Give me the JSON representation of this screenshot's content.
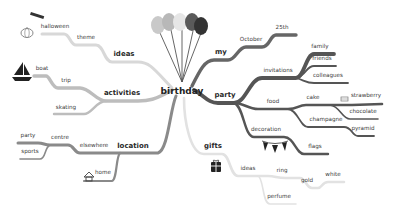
{
  "root": {
    "label": "birthday",
    "x": 182,
    "y": 91
  },
  "colors": {
    "ideas": "#d8d8d8",
    "activities": "#bdbdbd",
    "location": "#8a8a8a",
    "my": "#666666",
    "party": "#555555",
    "gifts": "#e2e2e2"
  },
  "nodes": [
    {
      "id": "ideas",
      "label": "ideas",
      "x": 124,
      "y": 58,
      "level": 1,
      "branch": "ideas"
    },
    {
      "id": "theme",
      "label": "theme",
      "x": 86,
      "y": 41,
      "level": 2,
      "branch": "ideas"
    },
    {
      "id": "halloween",
      "label": "halloween",
      "x": 55,
      "y": 30,
      "level": 3,
      "branch": "ideas"
    },
    {
      "id": "activities",
      "label": "activities",
      "x": 122,
      "y": 97,
      "level": 1,
      "branch": "activities"
    },
    {
      "id": "trip",
      "label": "trip",
      "x": 66,
      "y": 84,
      "level": 2,
      "branch": "activities"
    },
    {
      "id": "boat",
      "label": "boat",
      "x": 42,
      "y": 72,
      "level": 3,
      "branch": "activities"
    },
    {
      "id": "skating",
      "label": "skating",
      "x": 66,
      "y": 111,
      "level": 2,
      "branch": "activities"
    },
    {
      "id": "location",
      "label": "location",
      "x": 133,
      "y": 150,
      "level": 1,
      "branch": "location"
    },
    {
      "id": "elsewhere",
      "label": "elsewhere",
      "x": 94,
      "y": 149,
      "level": 2,
      "branch": "location"
    },
    {
      "id": "centre",
      "label": "centre",
      "x": 60,
      "y": 141,
      "level": 3,
      "branch": "location"
    },
    {
      "id": "party_loc",
      "label": "party",
      "x": 28,
      "y": 139,
      "level": 4,
      "branch": "location"
    },
    {
      "id": "sports",
      "label": "sports",
      "x": 30,
      "y": 155,
      "level": 4,
      "branch": "location"
    },
    {
      "id": "home",
      "label": "home",
      "x": 103,
      "y": 176,
      "level": 2,
      "branch": "location"
    },
    {
      "id": "my",
      "label": "my",
      "x": 221,
      "y": 56,
      "level": 1,
      "branch": "my"
    },
    {
      "id": "october",
      "label": "October",
      "x": 251,
      "y": 43,
      "level": 2,
      "branch": "my"
    },
    {
      "id": "25th",
      "label": "25th",
      "x": 282,
      "y": 31,
      "level": 3,
      "branch": "my"
    },
    {
      "id": "party",
      "label": "party",
      "x": 225,
      "y": 99,
      "level": 1,
      "branch": "party"
    },
    {
      "id": "invitations",
      "label": "invitations",
      "x": 278,
      "y": 74,
      "level": 2,
      "branch": "party"
    },
    {
      "id": "family",
      "label": "family",
      "x": 320,
      "y": 50,
      "level": 3,
      "branch": "party"
    },
    {
      "id": "friends",
      "label": "friends",
      "x": 322,
      "y": 62,
      "level": 3,
      "branch": "party"
    },
    {
      "id": "colleagues",
      "label": "colleagues",
      "x": 328,
      "y": 79,
      "level": 3,
      "branch": "party"
    },
    {
      "id": "food",
      "label": "food",
      "x": 273,
      "y": 105,
      "level": 2,
      "branch": "party"
    },
    {
      "id": "cake",
      "label": "cake",
      "x": 313,
      "y": 101,
      "level": 3,
      "branch": "party"
    },
    {
      "id": "strawberry",
      "label": "strawberry",
      "x": 366,
      "y": 99,
      "level": 4,
      "branch": "party"
    },
    {
      "id": "chocolate",
      "label": "chocolate",
      "x": 363,
      "y": 115,
      "level": 4,
      "branch": "party"
    },
    {
      "id": "champagne",
      "label": "champagne",
      "x": 326,
      "y": 123,
      "level": 3,
      "branch": "party"
    },
    {
      "id": "pyramid",
      "label": "pyramid",
      "x": 363,
      "y": 132,
      "level": 4,
      "branch": "party"
    },
    {
      "id": "decoration",
      "label": "decoration",
      "x": 266,
      "y": 133,
      "level": 2,
      "branch": "party"
    },
    {
      "id": "flags",
      "label": "flags",
      "x": 315,
      "y": 150,
      "level": 3,
      "branch": "party"
    },
    {
      "id": "gifts",
      "label": "gifts",
      "x": 213,
      "y": 150,
      "level": 1,
      "branch": "gifts"
    },
    {
      "id": "gifts_ideas",
      "label": "ideas",
      "x": 248,
      "y": 172,
      "level": 2,
      "branch": "gifts"
    },
    {
      "id": "ring",
      "label": "ring",
      "x": 282,
      "y": 174,
      "level": 3,
      "branch": "gifts"
    },
    {
      "id": "gold",
      "label": "gold",
      "x": 307,
      "y": 184,
      "level": 4,
      "branch": "gifts"
    },
    {
      "id": "white",
      "label": "white",
      "x": 333,
      "y": 178,
      "level": 5,
      "branch": "gifts"
    },
    {
      "id": "perfume",
      "label": "perfume",
      "x": 279,
      "y": 200,
      "level": 3,
      "branch": "gifts"
    }
  ],
  "links": [
    {
      "from": "root",
      "to": "ideas",
      "d": "M172,88 C155,70 150,62 138,62 L112,62 C104,62 104,45 96,45 L76,45 C70,45 70,34 64,34 L42,34",
      "w": 3,
      "branch": "ideas"
    },
    {
      "from": "root",
      "to": "activities",
      "d": "M172,90 C155,100 148,101 138,101 L106,101 C96,101 90,88 80,88 L58,88 C52,88 50,76 46,76 L34,76",
      "w": 3.4,
      "branch": "activities"
    },
    {
      "from": "activities",
      "to": "skating",
      "d": "M106,101 C96,101 92,114 84,114 L54,114",
      "w": 2.4,
      "branch": "activities"
    },
    {
      "from": "root",
      "to": "location",
      "d": "M176,96 C170,110 168,150 158,153 L116,153 C106,153 106,153 96,153 L80,153 C74,153 74,145 68,145 L50,145 C44,145 44,143 38,143 L18,143",
      "w": 3,
      "branch": "location"
    },
    {
      "from": "centre",
      "to": "sports",
      "d": "M50,145 C44,148 46,159 40,159 L20,159",
      "w": 1.6,
      "branch": "location"
    },
    {
      "from": "location",
      "to": "home",
      "d": "M120,153 C116,156 117,180 112,181 L84,181",
      "w": 2.2,
      "branch": "location"
    },
    {
      "from": "root",
      "to": "my",
      "d": "M192,86 C200,70 205,60 214,60 L228,60 C236,60 238,47 246,47 L262,47 C270,47 270,35 276,35 L296,35",
      "w": 3.4,
      "branch": "my"
    },
    {
      "from": "root",
      "to": "party",
      "d": "M194,90 C205,96 208,103 218,103 L234,103 C246,103 250,78 262,78 L296,78 C304,78 306,54 314,54 L334,54",
      "w": 3.8,
      "branch": "party"
    },
    {
      "from": "invitations",
      "to": "friends",
      "d": "M296,78 C306,76 306,66 314,66 L336,66",
      "w": 1.8,
      "branch": "party"
    },
    {
      "from": "invitations",
      "to": "colleagues",
      "d": "M296,78 C304,80 306,83 314,83 L348,83",
      "w": 1.8,
      "branch": "party"
    },
    {
      "from": "party",
      "to": "food",
      "d": "M234,103 C244,103 248,109 258,109 L288,109 C298,109 298,105 306,105 L352,105 L382,104",
      "w": 2.6,
      "branch": "party"
    },
    {
      "from": "cake",
      "to": "chocolate",
      "d": "M330,105 C340,106 342,119 350,119 L378,119",
      "w": 1.6,
      "branch": "party"
    },
    {
      "from": "food",
      "to": "champagne",
      "d": "M288,109 C298,110 300,127 308,127 L344,127 C352,127 352,136 358,136 L374,136",
      "w": 1.8,
      "branch": "party"
    },
    {
      "from": "party",
      "to": "decoration",
      "d": "M234,103 C244,106 244,137 254,137 L284,137 C294,137 296,154 304,154 L328,154",
      "w": 2.4,
      "branch": "party"
    },
    {
      "from": "root",
      "to": "gifts",
      "d": "M184,98 C184,120 190,154 204,154 L222,154 C230,154 230,176 238,176 L268,176 C276,176 276,178 286,178 L300,178 C306,178 306,188 312,188 L318,188 C322,188 322,182 328,182 L344,182",
      "w": 2.6,
      "branch": "gifts"
    },
    {
      "from": "gifts_ideas",
      "to": "perfume",
      "d": "M258,176 C264,178 262,204 270,204 L296,204",
      "w": 1.6,
      "branch": "gifts"
    }
  ],
  "icons": [
    {
      "name": "pumpkin-icon",
      "x": 14,
      "y": 26
    },
    {
      "name": "bats-icon",
      "x": 28,
      "y": 12
    },
    {
      "name": "sailboat-icon",
      "x": 14,
      "y": 64
    },
    {
      "name": "house-icon",
      "x": 86,
      "y": 172
    },
    {
      "name": "balloons-icon",
      "x": 150,
      "y": 14
    },
    {
      "name": "cake-icon",
      "x": 344,
      "y": 95
    },
    {
      "name": "bunting-flags-icon",
      "x": 254,
      "y": 139
    },
    {
      "name": "gift-box-icon",
      "x": 210,
      "y": 157
    }
  ]
}
